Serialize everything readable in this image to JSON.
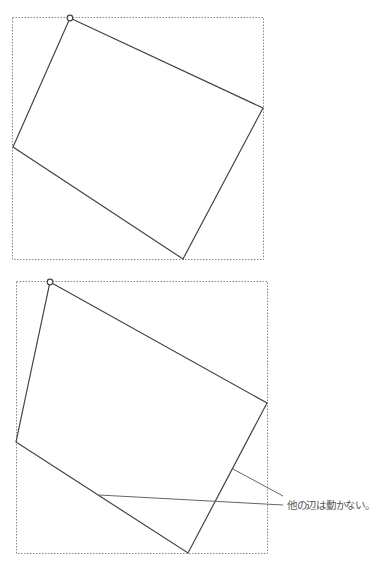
{
  "figures": [
    {
      "name": "before",
      "description": "Rotated rectangle inside dashed bounding box; top corner handle selected",
      "handle_icon": "circle-handle-icon"
    },
    {
      "name": "after",
      "description": "Top corner dragged left; other edges unchanged",
      "handle_icon": "circle-handle-icon"
    }
  ],
  "annotation": {
    "text": "他の辺は動かない。"
  },
  "colors": {
    "stroke": "#444444",
    "dashed": "#888888",
    "leader": "#666666"
  }
}
